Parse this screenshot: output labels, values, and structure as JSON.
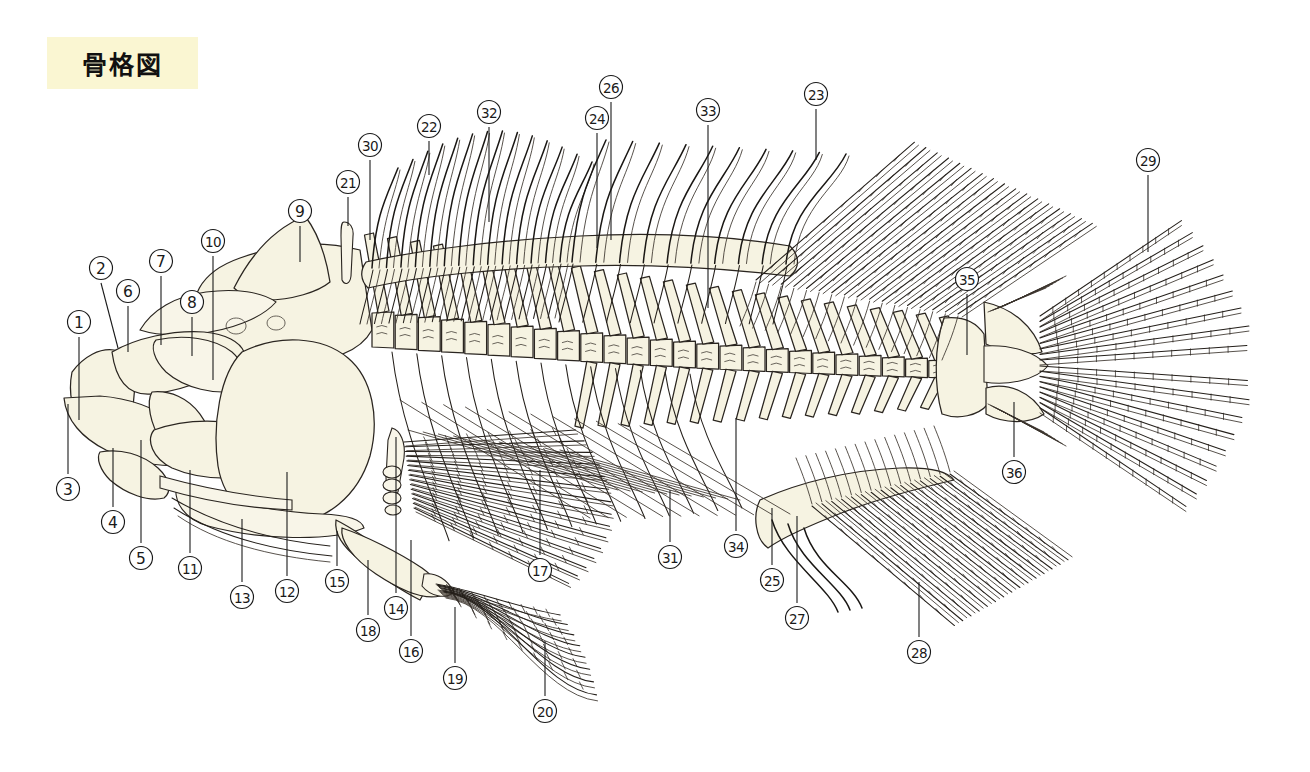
{
  "page": {
    "title": "骨格図",
    "background_color": "#ffffff",
    "banner_color": "#faf6d2",
    "bone_fill_color": "#f6f3e2",
    "line_color": "#241f1a",
    "width": 1310,
    "height": 772
  },
  "diagram": {
    "name": "fish-skeleton",
    "orientation": "left-facing head, right-facing tail",
    "regions": [
      "head-skull",
      "jaws",
      "opercle",
      "vertebral-column",
      "dorsal-fin-spinous",
      "dorsal-fin-soft",
      "pectoral-fin",
      "pelvic-fin",
      "anal-fin",
      "caudal-fin"
    ]
  },
  "labels": [
    {
      "id": 1,
      "text": "①",
      "cx": 79,
      "cy": 322,
      "lx": 79,
      "ly": 337,
      "tx": 79,
      "ty": 420
    },
    {
      "id": 2,
      "text": "②",
      "cx": 101,
      "cy": 268,
      "lx": 101,
      "ly": 283,
      "tx": 118,
      "ty": 348
    },
    {
      "id": 3,
      "text": "③",
      "cx": 68,
      "cy": 489,
      "lx": 68,
      "ly": 474,
      "tx": 68,
      "ty": 404
    },
    {
      "id": 4,
      "text": "④",
      "cx": 113,
      "cy": 522,
      "lx": 113,
      "ly": 507,
      "tx": 113,
      "ty": 448
    },
    {
      "id": 5,
      "text": "⑤",
      "cx": 141,
      "cy": 558,
      "lx": 141,
      "ly": 543,
      "tx": 141,
      "ty": 440
    },
    {
      "id": 6,
      "text": "⑥",
      "cx": 128,
      "cy": 291,
      "lx": 128,
      "ly": 306,
      "tx": 128,
      "ty": 352
    },
    {
      "id": 7,
      "text": "⑦",
      "cx": 161,
      "cy": 261,
      "lx": 161,
      "ly": 276,
      "tx": 161,
      "ty": 345
    },
    {
      "id": 8,
      "text": "⑧",
      "cx": 192,
      "cy": 302,
      "lx": 192,
      "ly": 317,
      "tx": 192,
      "ty": 356
    },
    {
      "id": 9,
      "text": "⑨",
      "cx": 300,
      "cy": 211,
      "lx": 300,
      "ly": 226,
      "tx": 300,
      "ty": 262
    },
    {
      "id": 10,
      "text": "⑩",
      "cx": 213,
      "cy": 241,
      "lx": 213,
      "ly": 256,
      "tx": 213,
      "ty": 380
    },
    {
      "id": 11,
      "text": "⑪",
      "cx": 190,
      "cy": 568,
      "lx": 190,
      "ly": 553,
      "tx": 190,
      "ty": 470
    },
    {
      "id": 12,
      "text": "⑫",
      "cx": 287,
      "cy": 591,
      "lx": 287,
      "ly": 576,
      "tx": 287,
      "ty": 472
    },
    {
      "id": 13,
      "text": "⑬",
      "cx": 242,
      "cy": 597,
      "lx": 242,
      "ly": 582,
      "tx": 242,
      "ty": 519
    },
    {
      "id": 14,
      "text": "⑭",
      "cx": 396,
      "cy": 608,
      "lx": 396,
      "ly": 593,
      "tx": 396,
      "ty": 437
    },
    {
      "id": 15,
      "text": "⑮",
      "cx": 337,
      "cy": 581,
      "lx": 337,
      "ly": 566,
      "tx": 337,
      "ty": 531
    },
    {
      "id": 16,
      "text": "⑯",
      "cx": 411,
      "cy": 651,
      "lx": 411,
      "ly": 636,
      "tx": 411,
      "ty": 540
    },
    {
      "id": 17,
      "text": "⑰",
      "cx": 540,
      "cy": 570,
      "lx": 540,
      "ly": 555,
      "tx": 540,
      "ty": 470
    },
    {
      "id": 18,
      "text": "⑱",
      "cx": 368,
      "cy": 630,
      "lx": 368,
      "ly": 615,
      "tx": 368,
      "ty": 560
    },
    {
      "id": 19,
      "text": "⑲",
      "cx": 455,
      "cy": 678,
      "lx": 455,
      "ly": 663,
      "tx": 455,
      "ty": 607
    },
    {
      "id": 20,
      "text": "⑳",
      "cx": 545,
      "cy": 711,
      "lx": 545,
      "ly": 696,
      "tx": 545,
      "ty": 641
    },
    {
      "id": 21,
      "text": "㉑",
      "cx": 348,
      "cy": 182,
      "lx": 348,
      "ly": 197,
      "tx": 348,
      "ty": 226
    },
    {
      "id": 22,
      "text": "㉒",
      "cx": 429,
      "cy": 126,
      "lx": 429,
      "ly": 141,
      "tx": 429,
      "ty": 175
    },
    {
      "id": 23,
      "text": "㉓",
      "cx": 816,
      "cy": 94,
      "lx": 816,
      "ly": 109,
      "tx": 816,
      "ty": 160
    },
    {
      "id": 24,
      "text": "㉔",
      "cx": 597,
      "cy": 118,
      "lx": 597,
      "ly": 133,
      "tx": 597,
      "ty": 248
    },
    {
      "id": 25,
      "text": "㉕",
      "cx": 772,
      "cy": 580,
      "lx": 772,
      "ly": 565,
      "tx": 772,
      "ty": 508
    },
    {
      "id": 26,
      "text": "㉖",
      "cx": 611,
      "cy": 87,
      "lx": 611,
      "ly": 102,
      "tx": 611,
      "ty": 240
    },
    {
      "id": 27,
      "text": "㉗",
      "cx": 797,
      "cy": 618,
      "lx": 797,
      "ly": 603,
      "tx": 797,
      "ty": 516
    },
    {
      "id": 28,
      "text": "㉘",
      "cx": 919,
      "cy": 652,
      "lx": 919,
      "ly": 637,
      "tx": 919,
      "ty": 582
    },
    {
      "id": 29,
      "text": "㉙",
      "cx": 1148,
      "cy": 160,
      "lx": 1148,
      "ly": 175,
      "tx": 1148,
      "ty": 252
    },
    {
      "id": 30,
      "text": "㉚",
      "cx": 370,
      "cy": 145,
      "lx": 370,
      "ly": 160,
      "tx": 370,
      "ty": 240
    },
    {
      "id": 31,
      "text": "㉛",
      "cx": 670,
      "cy": 557,
      "lx": 670,
      "ly": 542,
      "tx": 670,
      "ty": 490
    },
    {
      "id": 32,
      "text": "㉜",
      "cx": 489,
      "cy": 112,
      "lx": 489,
      "ly": 127,
      "tx": 489,
      "ty": 222
    },
    {
      "id": 33,
      "text": "㉝",
      "cx": 708,
      "cy": 110,
      "lx": 708,
      "ly": 125,
      "tx": 708,
      "ty": 308
    },
    {
      "id": 34,
      "text": "㉞",
      "cx": 736,
      "cy": 546,
      "lx": 736,
      "ly": 531,
      "tx": 736,
      "ty": 418
    },
    {
      "id": 35,
      "text": "㉟",
      "cx": 967,
      "cy": 279,
      "lx": 967,
      "ly": 294,
      "tx": 967,
      "ty": 355
    },
    {
      "id": 36,
      "text": "㊱",
      "cx": 1014,
      "cy": 472,
      "lx": 1014,
      "ly": 457,
      "tx": 1014,
      "ty": 402
    }
  ],
  "label_count": 36
}
